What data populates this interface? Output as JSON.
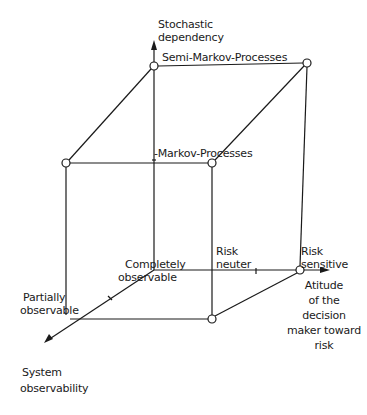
{
  "diagram": {
    "type": "3d-cube-classification",
    "axes": {
      "vertical": {
        "label_line1": "Stochastic",
        "label_line2": "dependency"
      },
      "horizontal": {
        "label_line1": "Atitude",
        "label_line2": "of the",
        "label_line3": "decision",
        "label_line4": "maker toward",
        "label_line5": "risk"
      },
      "depth": {
        "label_line1": "System",
        "label_line2": "observability"
      }
    },
    "levels": {
      "semi_markov": "Semi-Markov-Processes",
      "markov": "-Markov-Processes",
      "risk_neuter_line1": "Risk",
      "risk_neuter_line2": "neuter",
      "risk_sensitive_line1": "Risk",
      "risk_sensitive_line2": "sensitive",
      "completely_observable_line1": "Completely",
      "completely_observable_line2": "observable",
      "partially_observable_line1": "Partially",
      "partially_observable_line2": "observable"
    },
    "colors": {
      "line": "#1a1a1a",
      "background": "#ffffff"
    }
  }
}
